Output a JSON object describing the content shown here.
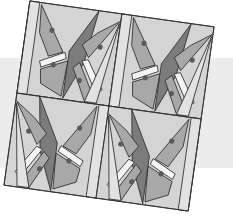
{
  "diagram": {
    "title": "",
    "grid": {
      "rows": 2,
      "cols": 2
    },
    "rotation_deg": 8,
    "colors": {
      "background": "#ffffff",
      "band": "#ececec",
      "light": "#d4d4d4",
      "lighter": "#e2e2e2",
      "white_strip": "#f4f4f4",
      "medium": "#a8a8a8",
      "dark": "#7c7c7c",
      "dot": "#5a5a5a",
      "line": "#2a2a2a"
    },
    "units": [
      {
        "id": "top-left",
        "flip": false
      },
      {
        "id": "top-right",
        "flip": false
      },
      {
        "id": "bottom-left",
        "flip": true
      },
      {
        "id": "bottom-right",
        "flip": true
      }
    ]
  }
}
